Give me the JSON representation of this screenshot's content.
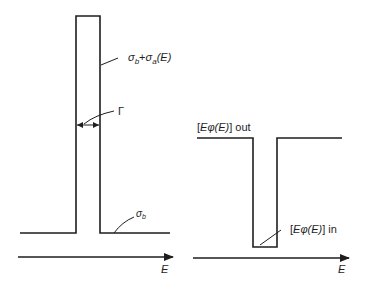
{
  "left_panel": {
    "peak_label_sigma": "σ",
    "peak_label_sub_b": "b",
    "peak_label_plus": "+",
    "peak_label_sigma2": "σ",
    "peak_label_sub_a": "a",
    "peak_label_arg": "(E)",
    "width_label": "Γ",
    "baseline_label_sigma": "σ",
    "baseline_label_sub": "b",
    "axis_label": "E"
  },
  "right_panel": {
    "out_label_prefix": "[",
    "out_label_expr": "Eφ(E)",
    "out_label_suffix": "] out",
    "in_label_prefix": "[",
    "in_label_expr": "Eφ(E)",
    "in_label_suffix": "] in",
    "axis_label": "E"
  },
  "colors": {
    "line": "#1e1e1e",
    "background": "#ffffff"
  }
}
